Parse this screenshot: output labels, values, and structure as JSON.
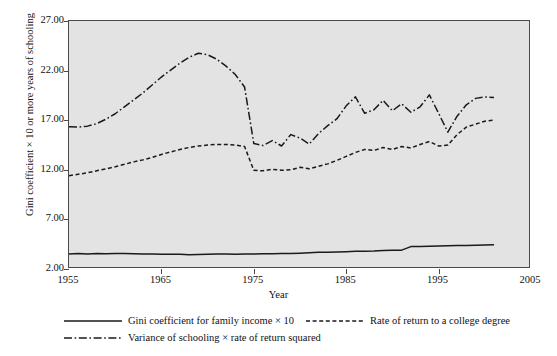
{
  "chart_data": {
    "type": "line",
    "title": "",
    "xlabel": "Year",
    "ylabel": "Gini coefficient × 10 or more years of schooling",
    "xlim": [
      1955,
      2005
    ],
    "ylim": [
      2.0,
      27.0
    ],
    "xticks": [
      1955,
      1965,
      1975,
      1985,
      1995,
      2005
    ],
    "xtick_labels": [
      "1955",
      "1965",
      "1975",
      "1985",
      "1995",
      "2005"
    ],
    "yticks": [
      2.0,
      7.0,
      12.0,
      17.0,
      22.0,
      27.0
    ],
    "ytick_labels": [
      "2.00",
      "7.00",
      "12.00",
      "17.00",
      "22.00",
      "27.00"
    ],
    "grid": false,
    "legend_position": "below",
    "plot_background": "#e3e3e3",
    "line_color": "#1a1a1a",
    "x": [
      1955,
      1956,
      1957,
      1958,
      1959,
      1960,
      1961,
      1962,
      1963,
      1964,
      1965,
      1966,
      1967,
      1968,
      1969,
      1970,
      1971,
      1972,
      1973,
      1974,
      1975,
      1976,
      1977,
      1978,
      1979,
      1980,
      1981,
      1982,
      1983,
      1984,
      1985,
      1986,
      1987,
      1988,
      1989,
      1990,
      1991,
      1992,
      1993,
      1994,
      1995,
      1996,
      1997,
      1998,
      1999,
      2000,
      2001
    ],
    "series": [
      {
        "name": "Gini coefficient for family income × 10",
        "style": "solid",
        "values": [
          3.52,
          3.55,
          3.52,
          3.56,
          3.54,
          3.55,
          3.57,
          3.54,
          3.52,
          3.5,
          3.48,
          3.49,
          3.48,
          3.44,
          3.46,
          3.48,
          3.5,
          3.5,
          3.49,
          3.5,
          3.52,
          3.53,
          3.54,
          3.55,
          3.57,
          3.6,
          3.63,
          3.68,
          3.7,
          3.72,
          3.74,
          3.78,
          3.8,
          3.82,
          3.86,
          3.88,
          3.9,
          4.26,
          4.28,
          4.3,
          4.32,
          4.34,
          4.37,
          4.38,
          4.4,
          4.42,
          4.44
        ]
      },
      {
        "name": "Rate of return to a college degree",
        "style": "dashed",
        "values": [
          11.4,
          11.55,
          11.7,
          11.9,
          12.1,
          12.3,
          12.55,
          12.8,
          13.0,
          13.25,
          13.55,
          13.8,
          14.05,
          14.25,
          14.4,
          14.5,
          14.55,
          14.55,
          14.5,
          14.35,
          11.95,
          11.9,
          12.05,
          11.95,
          12.0,
          12.25,
          12.1,
          12.35,
          12.6,
          12.95,
          13.35,
          13.75,
          14.05,
          13.95,
          14.25,
          14.05,
          14.35,
          14.2,
          14.55,
          14.85,
          14.4,
          14.5,
          15.55,
          16.3,
          16.6,
          16.9,
          17.0
        ]
      },
      {
        "name": "Variance of schooling × rate of return squared",
        "style": "dashdot",
        "values": [
          16.35,
          16.3,
          16.4,
          16.65,
          17.1,
          17.65,
          18.35,
          19.05,
          19.75,
          20.55,
          21.35,
          22.05,
          22.75,
          23.35,
          23.75,
          23.6,
          23.15,
          22.45,
          21.6,
          20.35,
          14.65,
          14.45,
          14.95,
          14.4,
          15.55,
          15.2,
          14.6,
          15.65,
          16.45,
          17.15,
          18.45,
          19.35,
          17.7,
          18.05,
          19.0,
          17.95,
          18.65,
          17.8,
          18.35,
          19.55,
          17.7,
          15.8,
          17.4,
          18.55,
          19.2,
          19.35,
          19.3
        ]
      }
    ]
  },
  "legend": {
    "items": [
      {
        "label": "Gini coefficient for family income × 10",
        "style": "solid"
      },
      {
        "label": "Rate of return to a college degree",
        "style": "dashed"
      },
      {
        "label": "Variance of schooling × rate of return squared",
        "style": "dashdot"
      }
    ]
  }
}
